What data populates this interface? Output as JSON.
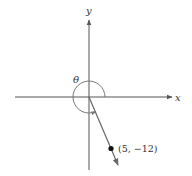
{
  "diagram": {
    "axes": {
      "x_label": "x",
      "y_label": "y"
    },
    "angle": {
      "label": "θ",
      "description": "angle in standard position measured counterclockwise from positive x-axis to terminal side",
      "degrees_approx": 292.6
    },
    "point": {
      "label": "(5, −12)",
      "x": 5,
      "y": -12
    },
    "colors": {
      "axis": "#555555",
      "ray": "#666666",
      "arc": "#777777",
      "point": "#111111",
      "text": "#333333"
    }
  }
}
